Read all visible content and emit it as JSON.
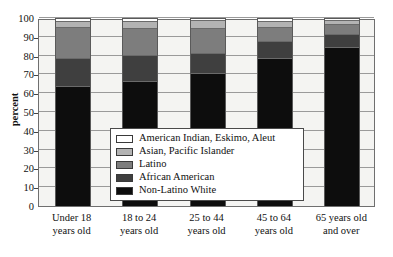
{
  "chart_data": {
    "type": "bar",
    "subtype": "stacked-bar-100-percent",
    "title": "",
    "xlabel": "",
    "ylabel": "percent",
    "ylim": [
      0,
      100
    ],
    "ytick_step": 10,
    "yticks": [
      0,
      10,
      20,
      30,
      40,
      50,
      60,
      70,
      80,
      90,
      100
    ],
    "grid": true,
    "legend_position": "inside-center",
    "categories": [
      "Under 18 years old",
      "18 to 24 years old",
      "25 to 44 years old",
      "45 to 64 years old",
      "65 years old and over"
    ],
    "category_lines": [
      [
        "Under 18",
        "years old"
      ],
      [
        "18 to 24",
        "years old"
      ],
      [
        "25 to 44",
        "years old"
      ],
      [
        "45 to 64",
        "years old"
      ],
      [
        "65 years old",
        "and over"
      ]
    ],
    "series": [
      {
        "name": "Non-Latino White",
        "color": "#0d0d0d",
        "values": [
          64,
          67,
          71,
          79,
          85
        ]
      },
      {
        "name": "African American",
        "color": "#3f3f3f",
        "values": [
          15,
          14,
          11,
          9,
          7
        ]
      },
      {
        "name": "Latino",
        "color": "#7d7d7d",
        "values": [
          16.5,
          14,
          13,
          7.5,
          5.5
        ]
      },
      {
        "name": "Asian, Pacific Islander",
        "color": "#b3b3b3",
        "values": [
          3.5,
          4,
          4.5,
          3.5,
          2
        ]
      },
      {
        "name": "American Indian, Eskimo, Aleut",
        "color": "#ffffff",
        "values": [
          1,
          1,
          0.5,
          1,
          0.5
        ]
      }
    ],
    "cumulative_tops": [
      [
        64,
        79,
        95.5,
        99,
        100
      ],
      [
        67,
        81,
        95,
        99,
        100
      ],
      [
        71,
        82,
        95,
        99.5,
        100
      ],
      [
        79,
        88,
        95.5,
        99,
        100
      ],
      [
        85,
        92,
        97.5,
        99.5,
        100
      ]
    ]
  },
  "legend": {
    "entries": [
      {
        "label": "American Indian, Eskimo, Aleut",
        "color": "#ffffff"
      },
      {
        "label": "Asian, Pacific Islander",
        "color": "#b3b3b3"
      },
      {
        "label": "Latino",
        "color": "#7d7d7d"
      },
      {
        "label": "African American",
        "color": "#3f3f3f"
      },
      {
        "label": "Non-Latino White",
        "color": "#0d0d0d"
      }
    ]
  },
  "axis": {
    "y_label": "percent",
    "y_ticks": [
      "100",
      "90",
      "80",
      "70",
      "60",
      "50",
      "40",
      "30",
      "20",
      "10",
      "0"
    ]
  }
}
